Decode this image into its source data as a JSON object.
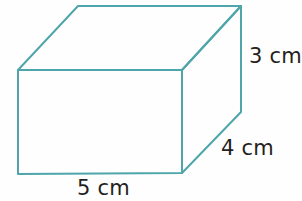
{
  "figure": {
    "kind": "geometry-diagram",
    "shape_name": "rectangular-prism",
    "background_color": "#fefefe",
    "edge_color": "#4ea5aa",
    "edge_width_px": 2,
    "label_color": "#241f20",
    "projection": "oblique-cabinet"
  },
  "labels": {
    "height": {
      "value": "3",
      "unit": "cm",
      "text": "3 cm"
    },
    "depth": {
      "value": "4",
      "unit": "cm",
      "text": "4 cm"
    },
    "width": {
      "value": "5",
      "unit": "cm",
      "text": "5 cm"
    }
  },
  "vertices": {
    "front_top_left": [
      18,
      70
    ],
    "front_top_right": [
      182,
      70
    ],
    "front_bottom_right": [
      182,
      173
    ],
    "front_bottom_left": [
      18,
      174
    ],
    "back_top_left": [
      78,
      6
    ],
    "back_top_right": [
      241,
      6
    ],
    "back_bottom_right": [
      241,
      112
    ]
  },
  "edges": [
    {
      "name": "front-top",
      "from": "front_top_left",
      "to": "front_top_right",
      "style": "solid"
    },
    {
      "name": "front-right",
      "from": "front_top_right",
      "to": "front_bottom_right",
      "style": "solid"
    },
    {
      "name": "front-bottom",
      "from": "front_bottom_right",
      "to": "front_bottom_left",
      "style": "solid"
    },
    {
      "name": "front-left",
      "from": "front_bottom_left",
      "to": "front_top_left",
      "style": "solid"
    },
    {
      "name": "top-left-diagonal",
      "from": "front_top_left",
      "to": "back_top_left",
      "style": "solid"
    },
    {
      "name": "top-back",
      "from": "back_top_left",
      "to": "back_top_right",
      "style": "solid"
    },
    {
      "name": "top-right-diagonal",
      "from": "back_top_right",
      "to": "front_top_right",
      "style": "solid"
    },
    {
      "name": "back-right-vertical",
      "from": "back_top_right",
      "to": "back_bottom_right",
      "style": "solid"
    },
    {
      "name": "bottom-right-diagonal",
      "from": "back_bottom_right",
      "to": "front_bottom_right",
      "style": "solid"
    }
  ]
}
